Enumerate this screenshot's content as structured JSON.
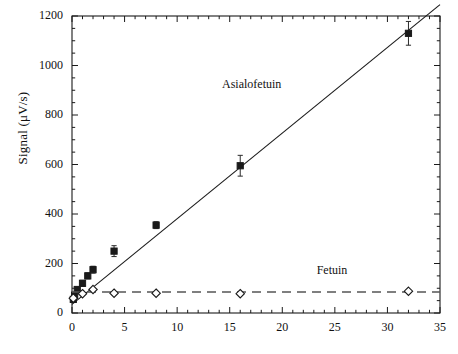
{
  "chart_data": {
    "type": "scatter",
    "title": "",
    "subtitle": "",
    "xlabel": "",
    "ylabel": "Signal (μV/s)",
    "xlim": [
      0,
      35
    ],
    "ylim": [
      0,
      1200
    ],
    "xticks": [
      0,
      5,
      10,
      15,
      20,
      25,
      30,
      35
    ],
    "xtick_labels": [
      "0",
      "5",
      "10",
      "15",
      "20",
      "25",
      "30",
      "35"
    ],
    "yticks": [
      0,
      200,
      400,
      600,
      800,
      1000,
      1200
    ],
    "ytick_labels": [
      "0",
      "200",
      "400",
      "600",
      "800",
      "1000",
      "1200"
    ],
    "x_minor_tick_step": 1,
    "y_minor_tick_step": 50,
    "grid": false,
    "legend_position": "inline-annotation",
    "frame": "box",
    "tick_direction": "in",
    "series": [
      {
        "name": "Asialofetuin",
        "marker": "filled-square",
        "marker_color": "#1a1a1a",
        "line_style": "solid",
        "line_color": "#1a1a1a",
        "fit_intercept": 35,
        "fit_slope": 34.6,
        "annotation": "Asialofetuin",
        "annotation_x": 17.5,
        "annotation_y": 920,
        "points": [
          {
            "x": 0.125,
            "y": 55,
            "yerr": 8
          },
          {
            "x": 0.25,
            "y": 72,
            "yerr": 8
          },
          {
            "x": 0.5,
            "y": 95,
            "yerr": 10
          },
          {
            "x": 1.0,
            "y": 120,
            "yerr": 12
          },
          {
            "x": 1.5,
            "y": 150,
            "yerr": 12
          },
          {
            "x": 2.0,
            "y": 175,
            "yerr": 14
          },
          {
            "x": 4.0,
            "y": 250,
            "yerr": 22
          },
          {
            "x": 8.0,
            "y": 355,
            "yerr": 14
          },
          {
            "x": 16.0,
            "y": 595,
            "yerr": 42
          },
          {
            "x": 32.0,
            "y": 1130,
            "yerr": 48
          }
        ]
      },
      {
        "name": "Fetuin",
        "marker": "open-diamond",
        "marker_color": "#1a1a1a",
        "line_style": "dashed",
        "line_color": "#555555",
        "level": 85,
        "annotation": "Fetuin",
        "annotation_x": 26.5,
        "annotation_y": 168,
        "points": [
          {
            "x": 0.125,
            "y": 60
          },
          {
            "x": 1.0,
            "y": 78
          },
          {
            "x": 2.0,
            "y": 95
          },
          {
            "x": 4.0,
            "y": 80
          },
          {
            "x": 8.0,
            "y": 80
          },
          {
            "x": 16.0,
            "y": 78
          },
          {
            "x": 32.0,
            "y": 88
          }
        ]
      }
    ]
  }
}
